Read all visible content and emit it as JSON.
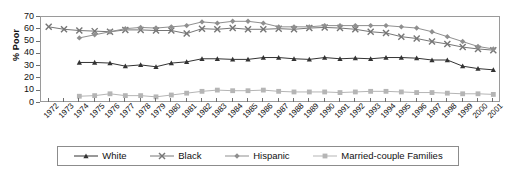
{
  "chart_data": {
    "type": "line",
    "title": "",
    "xlabel": "",
    "ylabel": "% Poor",
    "ylim": [
      0,
      70
    ],
    "ytick_step": 10,
    "yticks": [
      0,
      10,
      20,
      30,
      40,
      50,
      60,
      70
    ],
    "grid": false,
    "legend_position": "bottom",
    "x": [
      1972,
      1973,
      1974,
      1975,
      1976,
      1977,
      1978,
      1979,
      1980,
      1981,
      1982,
      1983,
      1984,
      1985,
      1986,
      1987,
      1988,
      1989,
      1990,
      1991,
      1992,
      1993,
      1994,
      1995,
      1996,
      1997,
      1998,
      1999,
      2000,
      2001
    ],
    "categories": [
      "1972",
      "1973",
      "1974",
      "1975",
      "1976",
      "1977",
      "1978",
      "1979",
      "1980",
      "1981",
      "1982",
      "1983",
      "1984",
      "1985",
      "1986",
      "1987",
      "1988",
      "1989",
      "1990",
      "1991",
      "1992",
      "1993",
      "1994",
      "1995",
      "1996",
      "1997",
      "1998",
      "1999",
      "2000",
      "2001"
    ],
    "series": [
      {
        "name": "White",
        "marker": "triangle",
        "color": "#333333",
        "values": [
          null,
          null,
          33,
          33,
          32.5,
          30,
          31,
          29.5,
          32.5,
          33.5,
          36,
          36,
          35.5,
          35.5,
          37,
          37,
          36,
          35.5,
          37,
          36,
          36.5,
          36,
          37,
          37,
          36.5,
          35,
          35,
          30,
          28,
          27
        ]
      },
      {
        "name": "Black",
        "marker": "x",
        "color": "#767676",
        "values": [
          62,
          60,
          59,
          58.5,
          58,
          59.5,
          59.5,
          59,
          59,
          56.5,
          60.5,
          60,
          61,
          60,
          60,
          60.5,
          60,
          61,
          61.5,
          61,
          60,
          58,
          57,
          54,
          52.5,
          50,
          48,
          45.5,
          44,
          43
        ]
      },
      {
        "name": "Hispanic",
        "marker": "diamond",
        "color": "#8f8f8f",
        "values": [
          null,
          null,
          53,
          55.5,
          58,
          60.5,
          61.5,
          61,
          62,
          63,
          66,
          65,
          66.5,
          66.5,
          65,
          62,
          62,
          62,
          63,
          63,
          63,
          63,
          63,
          62,
          61,
          58,
          54,
          50,
          46,
          44
        ]
      },
      {
        "name": "Married-couple Families",
        "marker": "square",
        "color": "#b5b5b5",
        "values": [
          null,
          null,
          5.5,
          6,
          7.5,
          6,
          6,
          5,
          6.5,
          8,
          9.5,
          10.5,
          10,
          10,
          10.5,
          9.5,
          9,
          9,
          9,
          8.5,
          9,
          9.5,
          9.5,
          9,
          8.5,
          8.5,
          8,
          7.5,
          7.5,
          7
        ]
      }
    ]
  },
  "axis": {
    "ylabel": "% Poor"
  },
  "legend": {
    "items": [
      {
        "label": "White",
        "marker": "triangle-marker",
        "color": "#333333"
      },
      {
        "label": "Black",
        "marker": "x-marker",
        "color": "#767676"
      },
      {
        "label": "Hispanic",
        "marker": "diamond-marker",
        "color": "#8f8f8f"
      },
      {
        "label": "Married-couple Families",
        "marker": "square-marker",
        "color": "#b5b5b5"
      }
    ]
  }
}
